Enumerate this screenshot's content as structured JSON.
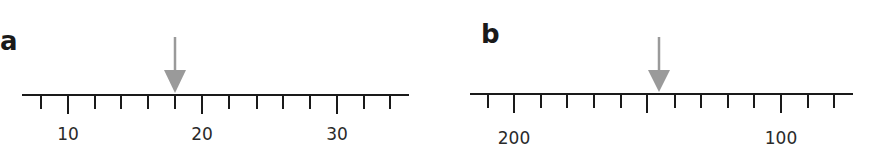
{
  "panels": [
    {
      "label": "a",
      "axis": {
        "x_start": 22,
        "x_end": 409,
        "y": 95
      },
      "ticks": [
        {
          "x": 41,
          "value": 8,
          "major": false
        },
        {
          "x": 68,
          "value": 10,
          "major": true,
          "label": "10"
        },
        {
          "x": 95,
          "value": 12,
          "major": false
        },
        {
          "x": 121,
          "value": 14,
          "major": false
        },
        {
          "x": 148,
          "value": 16,
          "major": false
        },
        {
          "x": 175,
          "value": 18,
          "major": false
        },
        {
          "x": 202,
          "value": 20,
          "major": true,
          "label": "20"
        },
        {
          "x": 229,
          "value": 22,
          "major": false
        },
        {
          "x": 257,
          "value": 24,
          "major": false
        },
        {
          "x": 283,
          "value": 26,
          "major": false
        },
        {
          "x": 310,
          "value": 28,
          "major": false
        },
        {
          "x": 337,
          "value": 30,
          "major": true,
          "label": "30"
        },
        {
          "x": 364,
          "value": 32,
          "major": false
        },
        {
          "x": 390,
          "value": 34,
          "major": false
        }
      ],
      "arrow": {
        "x": 175,
        "value": 18
      }
    },
    {
      "label": "b",
      "axis": {
        "x_start": 470,
        "x_end": 853,
        "y": 94
      },
      "ticks": [
        {
          "x": 488,
          "value": 210,
          "major": false
        },
        {
          "x": 514,
          "value": 200,
          "major": true,
          "label": "200"
        },
        {
          "x": 541,
          "value": 190,
          "major": false
        },
        {
          "x": 567,
          "value": 180,
          "major": false
        },
        {
          "x": 594,
          "value": 170,
          "major": false
        },
        {
          "x": 621,
          "value": 160,
          "major": false
        },
        {
          "x": 647,
          "value": 150,
          "major": true
        },
        {
          "x": 675,
          "value": 140,
          "major": false
        },
        {
          "x": 701,
          "value": 130,
          "major": false
        },
        {
          "x": 728,
          "value": 120,
          "major": false
        },
        {
          "x": 754,
          "value": 110,
          "major": false
        },
        {
          "x": 781,
          "value": 100,
          "major": true,
          "label": "100"
        },
        {
          "x": 808,
          "value": 90,
          "major": false
        },
        {
          "x": 834,
          "value": 80,
          "major": false
        }
      ],
      "arrow": {
        "x": 659,
        "value": 146
      }
    }
  ],
  "colors": {
    "axis": "#1a1a1a",
    "arrow": "#9a9a9a",
    "text": "#2a2a2a"
  }
}
